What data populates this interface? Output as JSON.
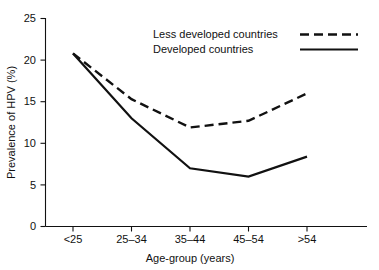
{
  "chart_data": {
    "type": "line",
    "title": "",
    "xlabel": "Age-group (years)",
    "ylabel": "Prevalence of HPV (%)",
    "categories": [
      "<25",
      "25–34",
      "35–44",
      "45–54",
      ">54"
    ],
    "ylim": [
      0,
      25
    ],
    "yticks": [
      0,
      5,
      10,
      15,
      20,
      25
    ],
    "ytick_labels": [
      "0",
      "5",
      "10",
      "15",
      "20",
      "25"
    ],
    "grid": false,
    "legend_position": "upper-center-inside",
    "series": [
      {
        "name": "Less developed countries",
        "style": "dashed",
        "color": "#111111",
        "values": [
          20.8,
          15.3,
          11.9,
          12.7,
          16.0
        ]
      },
      {
        "name": "Developed countries",
        "style": "solid",
        "color": "#111111",
        "values": [
          20.8,
          13.0,
          7.0,
          6.0,
          8.4
        ]
      }
    ]
  },
  "axes": {
    "y_title": "Prevalence of HPV (%)",
    "x_title": "Age-group (years)",
    "y_tick_0": "0",
    "y_tick_1": "5",
    "y_tick_2": "10",
    "y_tick_3": "15",
    "y_tick_4": "20",
    "y_tick_5": "25",
    "x_tick_0": "<25",
    "x_tick_1": "25–34",
    "x_tick_2": "35–44",
    "x_tick_3": "45–54",
    "x_tick_4": ">54"
  },
  "legend": {
    "entry_0_label": "Less developed countries",
    "entry_1_label": "Developed countries"
  }
}
